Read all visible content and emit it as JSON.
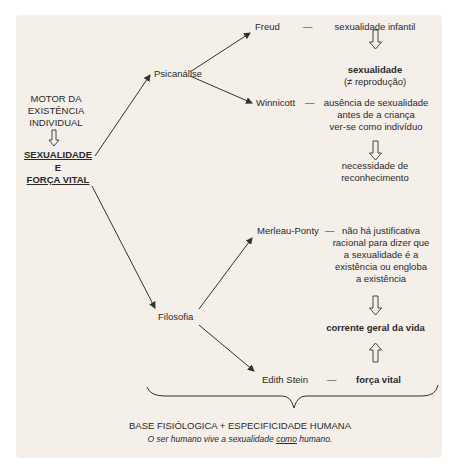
{
  "diagram": {
    "root": {
      "motor_lines": [
        "MOTOR DA",
        "EXISTÊNCIA",
        "INDIVIDUAL"
      ],
      "main_lines": [
        "SEXUALIDADE",
        "E",
        "FORÇA VITAL"
      ]
    },
    "branches": {
      "psicanalise": {
        "label": "Psicanálise",
        "freud": {
          "name": "Freud",
          "dash": "—",
          "text": "sexualidade infantil",
          "result_bold": "sexualidade",
          "result_note": "(≠ reprodução)"
        },
        "winnicott": {
          "name": "Winnicott",
          "dash": "—",
          "text_lines": [
            "ausência de sexualidade",
            "antes de a criança",
            "ver-se como indivíduo"
          ],
          "result_lines": [
            "necessidade de",
            "reconhecimento"
          ]
        }
      },
      "filosofia": {
        "label": "Filosofia",
        "merleau_ponty": {
          "name": "Merleau-Ponty",
          "dash": "—",
          "text_lines": [
            "não há justificativa",
            "racional para dizer que",
            "a sexualidade é a",
            "existência ou engloba",
            "a existência"
          ]
        },
        "center": "corrente geral da vida",
        "edith_stein": {
          "name": "Edith Stein",
          "dash": "—",
          "text": "força vital"
        }
      }
    },
    "footer": {
      "title": "BASE FISIÓLOGICA + ESPECIFICIDADE HUMANA",
      "caption_before": "O ser humano vive a sexualidade ",
      "caption_underlined": "como",
      "caption_after": " humano."
    },
    "colors": {
      "background": "#f4efe9",
      "text": "#2a2a2a",
      "lines": "#333333"
    }
  }
}
